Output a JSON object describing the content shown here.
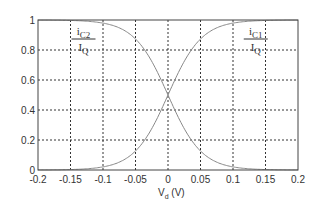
{
  "chart_data": {
    "type": "line",
    "title": "",
    "xlabel": "V_d (V)",
    "xlabel_main": "V",
    "xlabel_sub": "d",
    "xlabel_unit": " (V)",
    "ylabel": "",
    "xlim": [
      -0.2,
      0.2
    ],
    "ylim": [
      0,
      1
    ],
    "grid": true,
    "x_ticks": [
      "-0.2",
      "-0.15",
      "-0.1",
      "-0.05",
      "0",
      "0.05",
      "0.1",
      "0.15",
      "0.2"
    ],
    "y_ticks": [
      "0",
      "0.2",
      "0.4",
      "0.6",
      "0.8",
      "1"
    ],
    "x": [
      -0.15,
      -0.1,
      -0.075,
      -0.05,
      -0.025,
      0,
      0.025,
      0.05,
      0.075,
      0.1,
      0.15
    ],
    "series": [
      {
        "name": "iC1/IQ",
        "values": [
          0.0,
          0.02,
          0.05,
          0.12,
          0.27,
          0.5,
          0.73,
          0.88,
          0.95,
          0.98,
          1.0
        ]
      },
      {
        "name": "iC2/IQ",
        "values": [
          1.0,
          0.98,
          0.95,
          0.88,
          0.73,
          0.5,
          0.27,
          0.12,
          0.05,
          0.02,
          0.0
        ]
      }
    ],
    "annotations": [
      {
        "num": "i",
        "num_sub": "C2",
        "den": "I",
        "den_sub": "Q",
        "x": -0.13,
        "y": 0.88
      },
      {
        "num": "i",
        "num_sub": "C1",
        "den": "I",
        "den_sub": "Q",
        "x": 0.135,
        "y": 0.88
      }
    ]
  }
}
